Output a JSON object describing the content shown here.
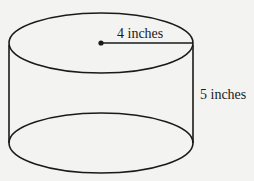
{
  "diagram": {
    "shape": "cylinder",
    "radius_label": "4 inches",
    "height_label": "5 inches",
    "stroke_color": "#1a1a1a",
    "background_color": "#f3f3f1"
  }
}
